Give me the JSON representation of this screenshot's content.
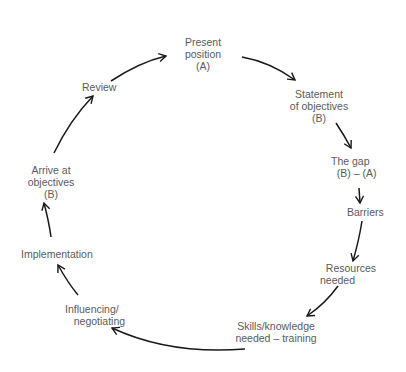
{
  "diagram": {
    "type": "cycle",
    "nodes": [
      {
        "id": "present",
        "label": "Present\nposition\n(A)"
      },
      {
        "id": "statement",
        "label": "Statement\nof objectives\n(B)"
      },
      {
        "id": "gap",
        "label": "The gap\n  (B) – (A)"
      },
      {
        "id": "barriers",
        "label": "Barriers"
      },
      {
        "id": "resources",
        "label": "  Resources\nneeded"
      },
      {
        "id": "skills",
        "label": "Skills/knowledge\nneeded – training"
      },
      {
        "id": "influencing",
        "label": "Influencing/\n   negotiating"
      },
      {
        "id": "implementation",
        "label": "Implementation"
      },
      {
        "id": "arrive",
        "label": "Arrive at\nobjectives\n(B)"
      },
      {
        "id": "review",
        "label": "Review"
      }
    ],
    "edges": [
      [
        "present",
        "statement"
      ],
      [
        "statement",
        "gap"
      ],
      [
        "gap",
        "barriers"
      ],
      [
        "barriers",
        "resources"
      ],
      [
        "resources",
        "skills"
      ],
      [
        "skills",
        "influencing"
      ],
      [
        "influencing",
        "implementation"
      ],
      [
        "implementation",
        "arrive"
      ],
      [
        "arrive",
        "review"
      ],
      [
        "review",
        "present"
      ]
    ]
  }
}
